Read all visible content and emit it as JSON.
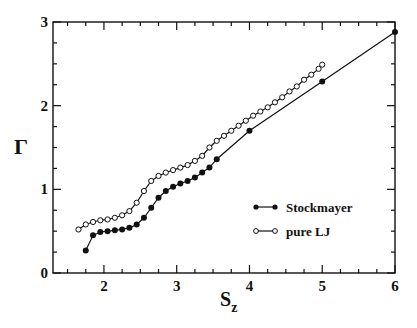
{
  "chart_data": {
    "type": "line",
    "title": "",
    "xlabel": "S_z",
    "xlabel_main": "S",
    "xlabel_sub": "z",
    "ylabel": "Γ",
    "xlim": [
      1.3,
      6.0
    ],
    "ylim": [
      0,
      3
    ],
    "x_ticks_major": [
      2,
      3,
      4,
      5,
      6
    ],
    "x_tick_labels": [
      "2",
      "3",
      "4",
      "5",
      "6"
    ],
    "x_tick_minor_step": 0.25,
    "y_ticks_major": [
      0,
      1,
      2,
      3
    ],
    "y_tick_labels": [
      "0",
      "1",
      "2",
      "3"
    ],
    "y_tick_minor_step": 0.25,
    "grid": false,
    "legend_position": "lower right",
    "series": [
      {
        "name": "Stockmayer",
        "marker": "filled-circle",
        "color": "#111111",
        "x": [
          1.75,
          1.85,
          1.95,
          2.05,
          2.15,
          2.25,
          2.35,
          2.45,
          2.55,
          2.65,
          2.75,
          2.85,
          2.95,
          3.05,
          3.15,
          3.25,
          3.35,
          3.45,
          3.55,
          4.0,
          5.0,
          6.0
        ],
        "y": [
          0.27,
          0.45,
          0.49,
          0.5,
          0.51,
          0.52,
          0.54,
          0.58,
          0.66,
          0.78,
          0.9,
          0.98,
          1.03,
          1.07,
          1.1,
          1.14,
          1.2,
          1.26,
          1.36,
          1.7,
          2.29,
          2.88
        ]
      },
      {
        "name": "pure LJ",
        "marker": "open-circle",
        "color": "#111111",
        "x": [
          1.65,
          1.75,
          1.85,
          1.95,
          2.05,
          2.15,
          2.25,
          2.35,
          2.45,
          2.55,
          2.65,
          2.75,
          2.85,
          2.95,
          3.05,
          3.15,
          3.25,
          3.35,
          3.45,
          3.55,
          3.65,
          3.75,
          3.85,
          3.95,
          4.05,
          4.15,
          4.25,
          4.35,
          4.45,
          4.55,
          4.65,
          4.75,
          4.85,
          4.95,
          5.0
        ],
        "y": [
          0.52,
          0.58,
          0.61,
          0.63,
          0.64,
          0.66,
          0.69,
          0.74,
          0.84,
          0.98,
          1.1,
          1.16,
          1.2,
          1.23,
          1.26,
          1.29,
          1.34,
          1.4,
          1.5,
          1.58,
          1.64,
          1.7,
          1.76,
          1.82,
          1.88,
          1.93,
          1.98,
          2.04,
          2.1,
          2.17,
          2.23,
          2.31,
          2.37,
          2.44,
          2.49
        ]
      }
    ]
  },
  "legend": {
    "items": [
      {
        "label": "Stockmayer",
        "marker": "filled-circle"
      },
      {
        "label": "pure LJ",
        "marker": "open-circle"
      }
    ]
  }
}
